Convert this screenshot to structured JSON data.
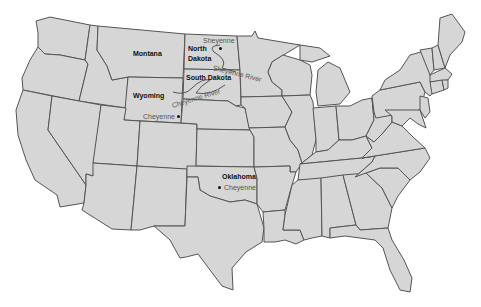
{
  "map": {
    "title": "United States map showing locations named Cheyenne",
    "colors": {
      "land": "#d6d6d6",
      "border": "#555555",
      "water": "#ffffff",
      "label": "#111111",
      "river_label": "#555555"
    },
    "states": [
      {
        "name": "Montana",
        "label": "Montana"
      },
      {
        "name": "North Dakota",
        "label_line1": "North",
        "label_line2": "Dakota"
      },
      {
        "name": "South Dakota",
        "label": "South Dakota"
      },
      {
        "name": "Wyoming",
        "label": "Wyoming"
      },
      {
        "name": "Oklahoma",
        "label": "Oklahoma"
      }
    ],
    "places": [
      {
        "name": "Sheyenne",
        "label": "Sheyenne",
        "state": "North Dakota"
      },
      {
        "name": "Cheyenne (Wyoming)",
        "label": "Cheyenne",
        "state": "Wyoming"
      },
      {
        "name": "Cheyenne (Oklahoma)",
        "label": "Cheyenne",
        "state": "Oklahoma"
      }
    ],
    "rivers": [
      {
        "name": "Sheyenne River",
        "label": "Sheyenne River"
      },
      {
        "name": "Cheyenne River",
        "label": "Cheyenne River"
      }
    ]
  }
}
